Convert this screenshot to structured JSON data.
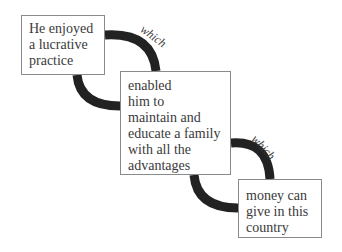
{
  "diagram": {
    "type": "sentence-chain",
    "nodes": [
      {
        "id": "box1",
        "lines": [
          "He enjoyed",
          "a lucrative",
          "practice"
        ]
      },
      {
        "id": "box2",
        "lines": [
          "enabled",
          "him to",
          "maintain and",
          "educate a family",
          "with all the",
          "advantages"
        ]
      },
      {
        "id": "box3",
        "lines": [
          "money can",
          "give in this",
          "country"
        ]
      }
    ],
    "connectors": [
      {
        "from": "box1",
        "to": "box2",
        "label": "which"
      },
      {
        "from": "box2",
        "to": "box3",
        "label": "which"
      }
    ],
    "colors": {
      "connector": "#222222",
      "border": "#8a8a8a",
      "text": "#3a3a3a"
    }
  }
}
